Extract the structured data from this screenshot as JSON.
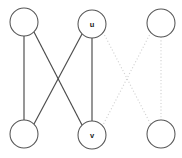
{
  "figure": {
    "width": 182,
    "height": 158,
    "background": "#ffffff"
  },
  "style": {
    "solid_edge_color": "#4a4a4a",
    "dotted_edge_color": "#d2d2d2",
    "node_fill": "#ffffff",
    "node_stroke": "#555555",
    "label_color": "#1a1a1a",
    "node_radius": 14
  },
  "nodes": [
    {
      "id": "tl",
      "label": "",
      "cx": 24,
      "cy": 22,
      "r": 14,
      "name": "node-top-left"
    },
    {
      "id": "u",
      "label": "u",
      "cx": 92,
      "cy": 24,
      "r": 14,
      "name": "node-u"
    },
    {
      "id": "tr",
      "label": "",
      "cx": 161,
      "cy": 23,
      "r": 14,
      "name": "node-top-right"
    },
    {
      "id": "bl",
      "label": "",
      "cx": 24,
      "cy": 134,
      "r": 14,
      "name": "node-bottom-left"
    },
    {
      "id": "v",
      "label": "v",
      "cx": 92,
      "cy": 135,
      "r": 14,
      "name": "node-v"
    },
    {
      "id": "br",
      "label": "",
      "cx": 161,
      "cy": 134,
      "r": 14,
      "name": "node-bottom-right"
    }
  ],
  "edges": [
    {
      "id": "e1",
      "from": "tl",
      "to": "bl",
      "style": "solid",
      "x1": 24,
      "y1": 36,
      "x2": 24,
      "y2": 120,
      "name": "edge-topleft-bottomleft"
    },
    {
      "id": "e2",
      "from": "tl",
      "to": "v",
      "style": "solid",
      "x1": 34,
      "y1": 32,
      "x2": 82,
      "y2": 125,
      "name": "edge-topleft-v"
    },
    {
      "id": "e3",
      "from": "u",
      "to": "bl",
      "style": "solid",
      "x1": 82,
      "y1": 34,
      "x2": 34,
      "y2": 124,
      "name": "edge-u-bottomleft"
    },
    {
      "id": "e4",
      "from": "u",
      "to": "v",
      "style": "solid",
      "x1": 92,
      "y1": 38,
      "x2": 92,
      "y2": 121,
      "name": "edge-u-v"
    },
    {
      "id": "e5",
      "from": "u",
      "to": "br",
      "style": "dotted",
      "x1": 103,
      "y1": 32,
      "x2": 151,
      "y2": 125,
      "name": "edge-u-bottomright"
    },
    {
      "id": "e6",
      "from": "tr",
      "to": "v",
      "style": "dotted",
      "x1": 151,
      "y1": 32,
      "x2": 103,
      "y2": 125,
      "name": "edge-topright-v"
    },
    {
      "id": "e7",
      "from": "tr",
      "to": "br",
      "style": "dotted",
      "x1": 161,
      "y1": 37,
      "x2": 161,
      "y2": 120,
      "name": "edge-topright-bottomright"
    }
  ]
}
